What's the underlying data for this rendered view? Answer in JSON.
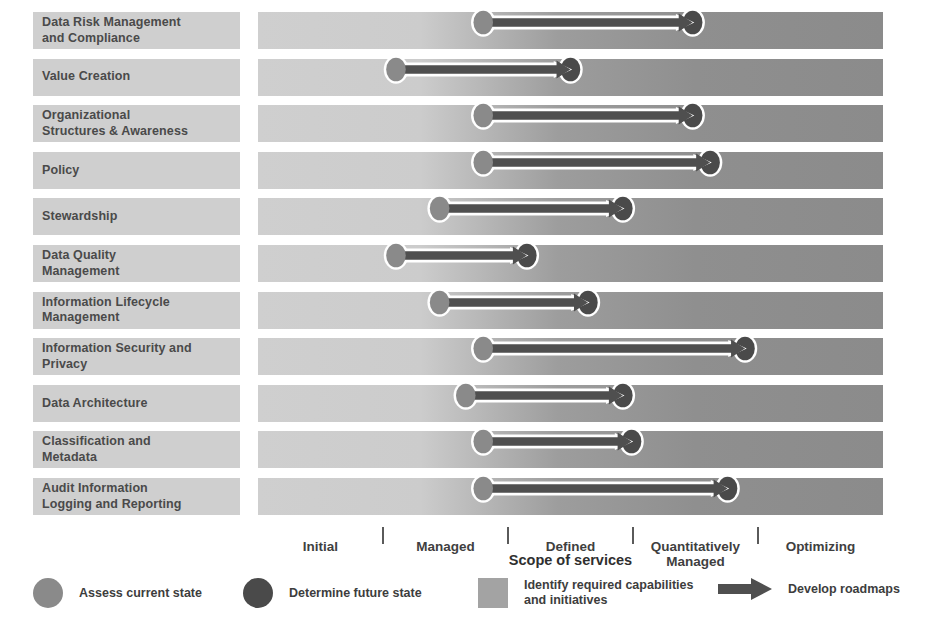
{
  "chart_data": {
    "type": "bar",
    "title": "",
    "xlabel": "Scope of services",
    "ylabel": "",
    "grid": false,
    "legend_position": "bottom",
    "x_axis": {
      "title": "Scope of services",
      "tick_labels": [
        "Initial",
        "Managed",
        "Defined",
        "Quantitatively Managed",
        "Optimizing"
      ],
      "levels": [
        1,
        2,
        3,
        4,
        5
      ],
      "xlim": [
        0.5,
        5.5
      ]
    },
    "categories": [
      "Data Risk Management and Compliance",
      "Value Creation",
      "Organizational Structures & Awareness",
      "Policy",
      "Stewardship",
      "Data Quality Management",
      "Information Lifecycle Management",
      "Information Security and Privacy",
      "Data Architecture",
      "Classification and Metadata",
      "Audit Information Logging and Reporting"
    ],
    "series": [
      {
        "name": "Assess current state",
        "values": [
          2.0,
          1.0,
          2.0,
          2.0,
          1.5,
          1.0,
          1.5,
          2.0,
          1.8,
          2.0,
          2.0
        ]
      },
      {
        "name": "Determine future state",
        "values": [
          4.4,
          3.0,
          4.4,
          4.6,
          3.6,
          2.5,
          3.2,
          5.0,
          3.6,
          3.7,
          4.8
        ]
      }
    ]
  },
  "rows": [
    {
      "label_lines": [
        "Data Risk Management",
        "and Compliance"
      ],
      "current": 2.0,
      "future": 4.4
    },
    {
      "label_lines": [
        "Value Creation"
      ],
      "current": 1.0,
      "future": 3.0
    },
    {
      "label_lines": [
        "Organizational",
        "Structures & Awareness"
      ],
      "current": 2.0,
      "future": 4.4
    },
    {
      "label_lines": [
        "Policy"
      ],
      "current": 2.0,
      "future": 4.6
    },
    {
      "label_lines": [
        "Stewardship"
      ],
      "current": 1.5,
      "future": 3.6
    },
    {
      "label_lines": [
        "Data Quality",
        "Management"
      ],
      "current": 1.0,
      "future": 2.5
    },
    {
      "label_lines": [
        "Information Lifecycle",
        "Management"
      ],
      "current": 1.5,
      "future": 3.2
    },
    {
      "label_lines": [
        "Information Security and",
        "Privacy"
      ],
      "current": 2.0,
      "future": 5.0
    },
    {
      "label_lines": [
        "Data Architecture"
      ],
      "current": 1.8,
      "future": 3.6
    },
    {
      "label_lines": [
        "Classification and",
        "Metadata"
      ],
      "current": 2.0,
      "future": 3.7
    },
    {
      "label_lines": [
        "Audit Information",
        "Logging and Reporting"
      ],
      "current": 2.0,
      "future": 4.8
    }
  ],
  "axis": {
    "title": "Scope of services",
    "ticks": [
      {
        "label": "Initial"
      },
      {
        "label": "Managed"
      },
      {
        "label": "Defined"
      },
      {
        "label_lines": [
          "Quantitatively",
          "Managed"
        ]
      },
      {
        "label": "Optimizing"
      }
    ]
  },
  "legend": [
    {
      "marker": "circle-light",
      "text_lines": [
        "Assess current state"
      ]
    },
    {
      "marker": "circle-dark",
      "text_lines": [
        "Determine future state"
      ]
    },
    {
      "marker": "square-gray",
      "text_lines": [
        "Identify required capabilities",
        "and initiatives"
      ]
    },
    {
      "marker": "arrow-right",
      "text_lines": [
        "Develop roadmaps"
      ]
    }
  ],
  "colors": {
    "label_box": "#cfcfcf",
    "bar_light": "#cfcfcf",
    "bar_dark": "#8b8b8b",
    "circle_current": "#8a8a8a",
    "circle_future": "#4a4a4a",
    "arrow": "#4f4f4f",
    "arrow_outline": "#ffffff",
    "text": "#3d3d3d"
  }
}
